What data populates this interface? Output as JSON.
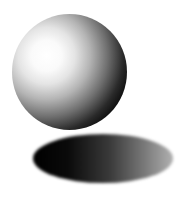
{
  "scene": {
    "description": "Shaded 3D sphere floating above its elliptical cast shadow",
    "sphere": {
      "shading": "grayscale",
      "highlight": "upper-left"
    },
    "shadow": {
      "shape": "ellipse",
      "gradient": "dark left to light gray right"
    },
    "colors": {
      "background": "#ffffff",
      "sphere_highlight": "#ffffff",
      "sphere_core": "#000000",
      "shadow_dark": "#000000",
      "shadow_light": "#b0b0b0"
    }
  }
}
